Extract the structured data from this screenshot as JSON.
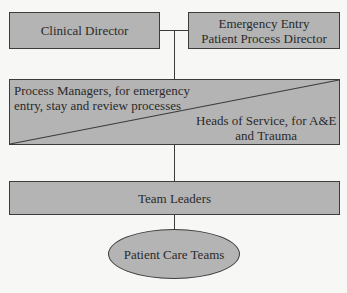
{
  "diagram": {
    "type": "organizational-hierarchy",
    "nodes": {
      "clinical_director": "Clinical Director",
      "emergency_director_line1": "Emergency Entry",
      "emergency_director_line2": "Patient Process Director",
      "process_managers_line1": "Process Managers, for emergency",
      "process_managers_line2": "entry, stay and review processes",
      "heads_of_service_line1": "Heads of Service, for A&E",
      "heads_of_service_line2": "and Trauma",
      "team_leaders": "Team Leaders",
      "patient_care_teams": "Patient Care Teams"
    },
    "colors": {
      "box_fill": "#b4b4b4",
      "stroke": "#3c3c3c",
      "background": "#f7f7f5"
    }
  }
}
